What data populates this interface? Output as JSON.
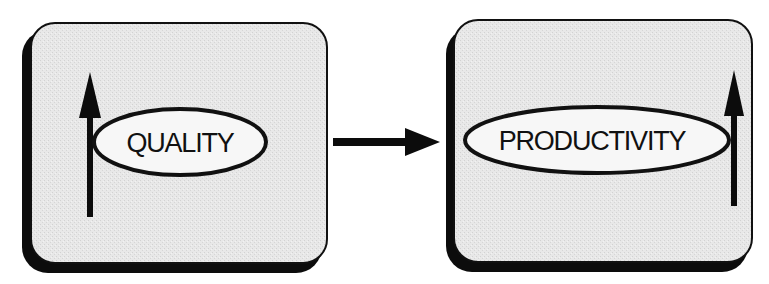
{
  "diagram": {
    "type": "flow",
    "colors": {
      "background": "#ffffff",
      "box_face": "#e6e6e6",
      "box_shadow": "#0c0c0c",
      "ellipse_fill": "#f7f7f7",
      "stroke": "#111111"
    },
    "nodes": [
      {
        "id": "quality",
        "label": "QUALITY",
        "trend": "up-arrow",
        "trend_position": "left"
      },
      {
        "id": "productivity",
        "label": "PRODUCTIVITY",
        "trend": "up-arrow",
        "trend_position": "right"
      }
    ],
    "edges": [
      {
        "from": "quality",
        "to": "productivity",
        "style": "solid-arrow"
      }
    ]
  }
}
